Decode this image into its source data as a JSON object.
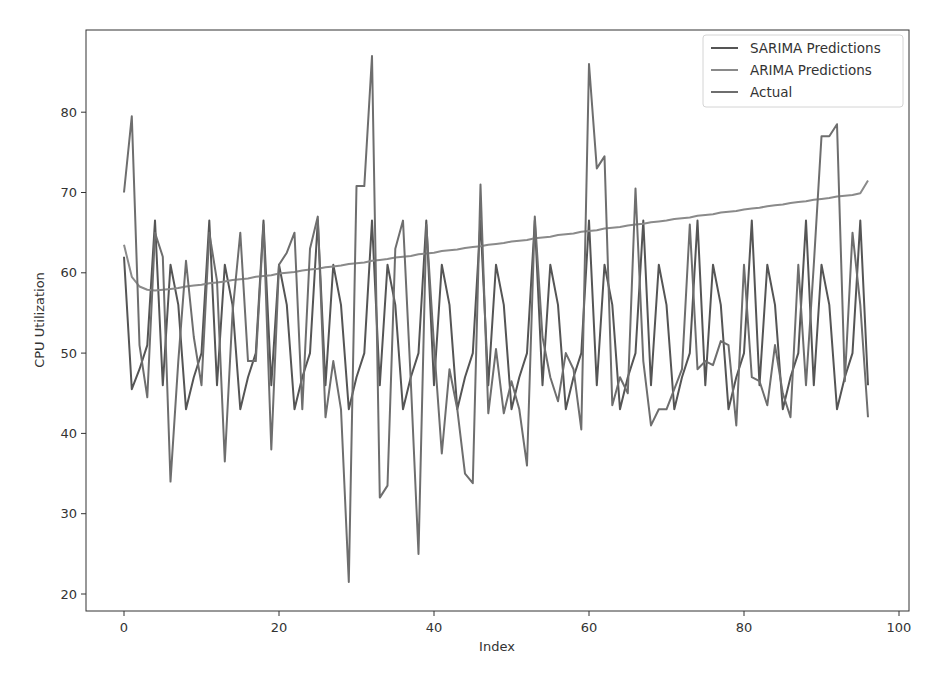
{
  "chart_data": {
    "type": "line",
    "title": "",
    "xlabel": "Index",
    "ylabel": "CPU Utilization",
    "xlim": [
      -5,
      101
    ],
    "ylim": [
      18,
      90
    ],
    "xticks": [
      0,
      20,
      40,
      60,
      80,
      100
    ],
    "yticks": [
      20,
      30,
      40,
      50,
      60,
      70,
      80
    ],
    "grid": false,
    "legend_position": "upper right",
    "series": [
      {
        "name": "SARIMA Predictions",
        "color": "#555555",
        "x_start": 0,
        "values": [
          62,
          45.5,
          48,
          51,
          66.5,
          46,
          61,
          56,
          43,
          47,
          50,
          66.5,
          46,
          61,
          56,
          43,
          47,
          50,
          66.5,
          46,
          61,
          56,
          43,
          47,
          50,
          66.5,
          46,
          61,
          56,
          43,
          47,
          50,
          66.5,
          46,
          61,
          56,
          43,
          47,
          50,
          66.5,
          46,
          61,
          56,
          43,
          47,
          50,
          66.5,
          46,
          61,
          56,
          43,
          47,
          50,
          66.5,
          46,
          61,
          56,
          43,
          47,
          50,
          66.5,
          46,
          61,
          56,
          43,
          47,
          50,
          66.5,
          46,
          61,
          56,
          43,
          47,
          50,
          66.5,
          46,
          61,
          56,
          43,
          47,
          50,
          66.5,
          46,
          61,
          56,
          43,
          47,
          50,
          66.5,
          46,
          61,
          56,
          43,
          47,
          50,
          66.5,
          46
        ]
      },
      {
        "name": "ARIMA Predictions",
        "color": "#8a8a8a",
        "x_start": 0,
        "values": [
          63.5,
          59.5,
          58.3,
          57.9,
          57.8,
          57.9,
          58.0,
          58.1,
          58.3,
          58.4,
          58.5,
          58.7,
          58.8,
          58.9,
          59.1,
          59.2,
          59.3,
          59.5,
          59.6,
          59.7,
          59.9,
          60.0,
          60.1,
          60.3,
          60.4,
          60.5,
          60.7,
          60.8,
          60.9,
          61.1,
          61.2,
          61.3,
          61.5,
          61.6,
          61.7,
          61.9,
          62.0,
          62.1,
          62.3,
          62.4,
          62.5,
          62.7,
          62.8,
          62.9,
          63.1,
          63.2,
          63.3,
          63.5,
          63.6,
          63.7,
          63.9,
          64.0,
          64.1,
          64.3,
          64.4,
          64.5,
          64.7,
          64.8,
          64.9,
          65.1,
          65.2,
          65.3,
          65.5,
          65.6,
          65.7,
          65.9,
          66.0,
          66.1,
          66.3,
          66.4,
          66.5,
          66.7,
          66.8,
          66.9,
          67.1,
          67.2,
          67.3,
          67.5,
          67.6,
          67.7,
          67.9,
          68.0,
          68.1,
          68.3,
          68.4,
          68.5,
          68.7,
          68.8,
          68.9,
          69.1,
          69.2,
          69.3,
          69.5,
          69.6,
          69.7,
          69.9,
          71.5
        ]
      },
      {
        "name": "Actual",
        "color": "#6e6e6e",
        "x_start": 0,
        "values": [
          70,
          79.5,
          51,
          44.5,
          65,
          62,
          34,
          49,
          61.5,
          52,
          46,
          65,
          59,
          36.5,
          55,
          65,
          49,
          49,
          66,
          38,
          61,
          62.5,
          65,
          43,
          63,
          67,
          42,
          49,
          43,
          21.5,
          70.8,
          70.8,
          87,
          32,
          33.5,
          63,
          66.5,
          46.5,
          25,
          66,
          51,
          37.5,
          48,
          43,
          35,
          33.8,
          71,
          42.5,
          50.5,
          42.5,
          46.5,
          43,
          36,
          67,
          52,
          47,
          44,
          50,
          48,
          40.5,
          86,
          73,
          74.5,
          43.5,
          47,
          45,
          70.5,
          49,
          41,
          43,
          43,
          45.5,
          48,
          66,
          48,
          49,
          48.5,
          51.5,
          51,
          41,
          61,
          47,
          46.5,
          43.5,
          51,
          45,
          42,
          61,
          46,
          61,
          77,
          77,
          78.5,
          46.5,
          65,
          56,
          42
        ]
      }
    ]
  },
  "axes": {
    "xlabel": "Index",
    "ylabel": "CPU Utilization",
    "xtick_labels": [
      "0",
      "20",
      "40",
      "60",
      "80",
      "100"
    ],
    "ytick_labels": [
      "20",
      "30",
      "40",
      "50",
      "60",
      "70",
      "80"
    ]
  },
  "legend": {
    "items": [
      "SARIMA Predictions",
      "ARIMA Predictions",
      "Actual"
    ]
  }
}
